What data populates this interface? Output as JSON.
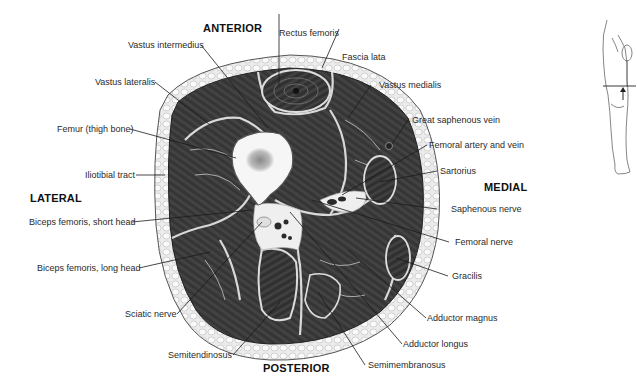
{
  "figure": {
    "orientation": {
      "anterior": "ANTERIOR",
      "posterior": "POSTERIOR",
      "lateral": "LATERAL",
      "medial": "MEDIAL"
    },
    "labels": {
      "rectus_femoris": "Rectus femoris",
      "vastus_intermedius": "Vastus intermedius",
      "fascia_lata": "Fascia lata",
      "vastus_lateralis": "Vastus lateralis",
      "vastus_medialis": "Vastus medialis",
      "femur": "Femur (thigh bone)",
      "great_saphenous_vein": "Great saphenous vein",
      "femoral_artery_vein": "Femoral artery and vein",
      "iliotibial_tract": "Iliotibial tract",
      "sartorius": "Sartorius",
      "biceps_short": "Biceps femoris, short head",
      "saphenous_nerve": "Saphenous nerve",
      "femoral_nerve": "Femoral nerve",
      "biceps_long": "Biceps femoris, long head",
      "gracilis": "Gracilis",
      "sciatic_nerve": "Sciatic nerve",
      "adductor_magnus": "Adductor magnus",
      "adductor_longus": "Adductor longus",
      "semitendinosus": "Semitendinosus",
      "semimembranosus": "Semimembranosus"
    },
    "colors": {
      "muscle": "#3a3a3a",
      "fat": "#e6e6e6",
      "bone": "#f4f4f4",
      "leader": "#1a1a1a"
    },
    "inset": {
      "description": "Leg outline with horizontal section line and upward arrow"
    }
  }
}
